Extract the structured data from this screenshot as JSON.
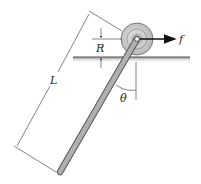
{
  "diagram": {
    "type": "mechanics-figure",
    "labels": {
      "length": "L",
      "radius": "R",
      "force": "f",
      "angle": "θ"
    },
    "colors": {
      "rod": "#a9a9a9",
      "rod_edge": "#555555",
      "wheel": "#c8c8c8",
      "ground": "#bfbfbf",
      "ink": "#222222"
    }
  }
}
